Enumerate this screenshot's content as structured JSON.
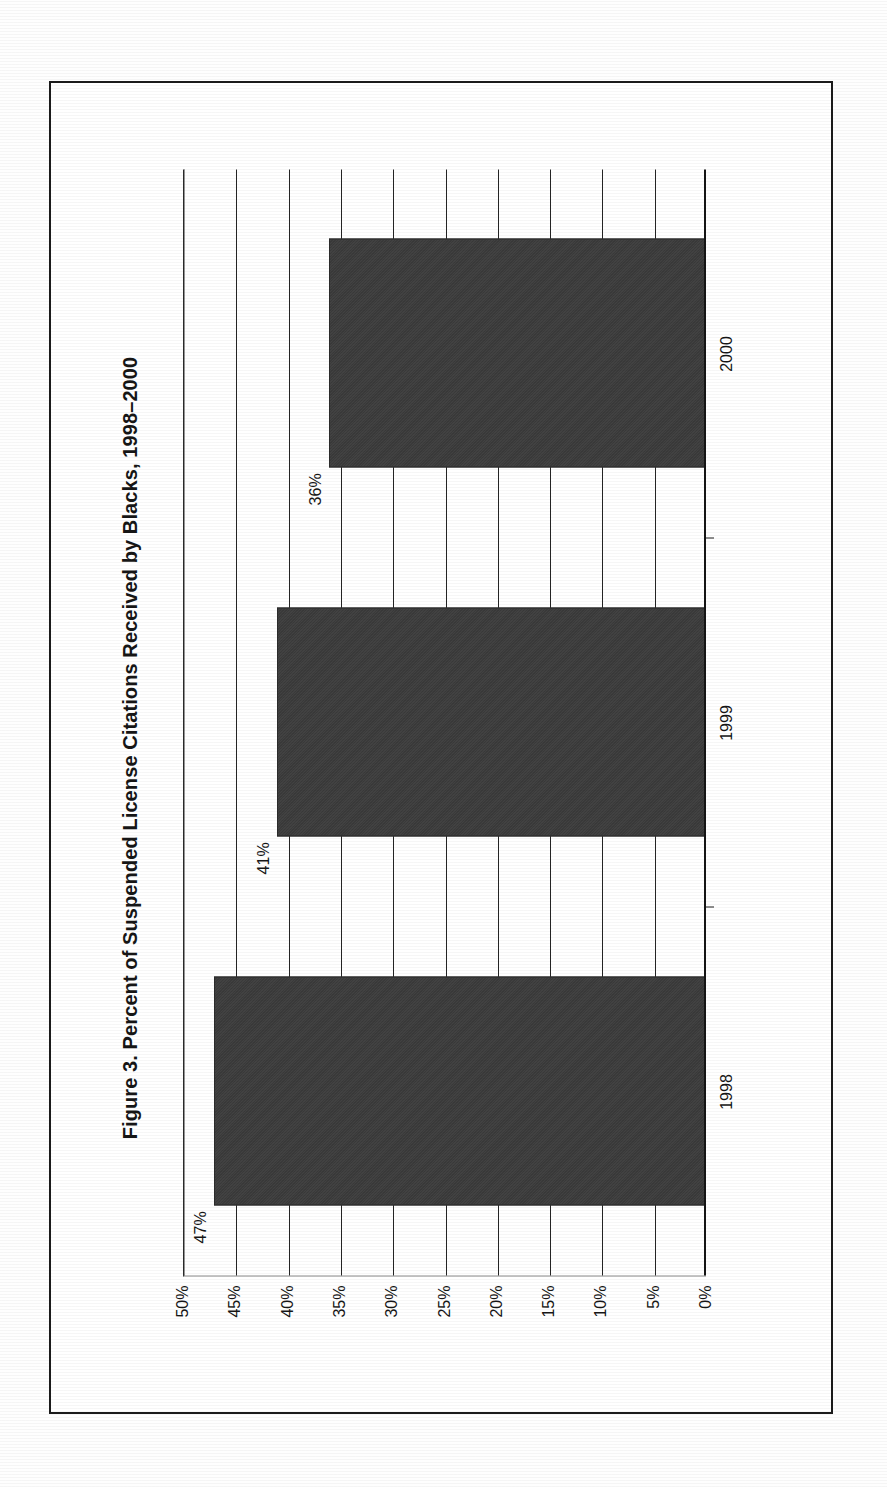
{
  "figure": {
    "title": "Figure 3. Percent of Suspended License Citations Received by Blacks, 1998–2000",
    "orientation": "rotated-90-ccw",
    "frame_color": "#1b1b1b",
    "bar_color": "#3a3a3a",
    "background_color": "#ffffff"
  },
  "chart_data": {
    "type": "bar",
    "title": "Figure 3. Percent of Suspended License Citations Received by Blacks, 1998–2000",
    "xlabel": "",
    "ylabel": "",
    "categories": [
      "1998",
      "1999",
      "2000"
    ],
    "values": [
      47,
      41,
      36
    ],
    "value_labels": [
      "47%",
      "41%",
      "36%"
    ],
    "ylim": [
      0,
      50
    ],
    "yticks": [
      0,
      5,
      10,
      15,
      20,
      25,
      30,
      35,
      40,
      45,
      50
    ],
    "ytick_labels": [
      "0%",
      "5%",
      "10%",
      "15%",
      "20%",
      "25%",
      "30%",
      "35%",
      "40%",
      "45%",
      "50%"
    ],
    "grid": true,
    "legend": null,
    "series": [
      {
        "name": "Percent of Suspended License Citations Received by Blacks",
        "values": [
          47,
          41,
          36
        ]
      }
    ]
  }
}
